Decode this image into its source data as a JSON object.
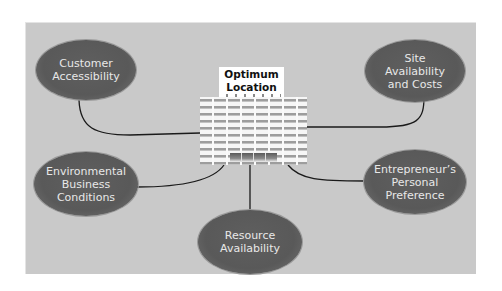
{
  "diagram": {
    "center": {
      "title_line1": "Optimum",
      "title_line2": "Location",
      "icon": "office-building-icon"
    },
    "nodes": [
      {
        "id": "customer-accessibility",
        "label": "Customer\nAccessibility"
      },
      {
        "id": "site-availability-costs",
        "label": "Site\nAvailability\nand Costs"
      },
      {
        "id": "environmental-business-conditions",
        "label": "Environmental\nBusiness\nConditions"
      },
      {
        "id": "resource-availability",
        "label": "Resource\nAvailability"
      },
      {
        "id": "entrepreneurs-personal-preference",
        "label": "Entrepreneur’s\nPersonal\nPreference"
      }
    ],
    "colors": {
      "panel_background": "#c9c9c9",
      "node_fill": "#5c5c5c",
      "node_text": "#e8e8e8",
      "connector": "#1a1a1a",
      "title_box": "#ffffff"
    }
  }
}
